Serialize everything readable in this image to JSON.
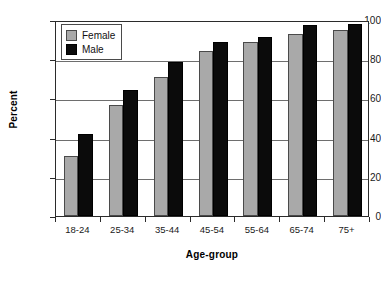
{
  "chart_data": {
    "type": "bar",
    "title": "",
    "subtitle": "",
    "xlabel": "Age-group",
    "ylabel": "Percent",
    "categories": [
      "18-24",
      "25-34",
      "35-44",
      "45-54",
      "55-64",
      "65-74",
      "75+"
    ],
    "series": [
      {
        "name": "Female",
        "color": "#a9a9a9",
        "values": [
          30.5,
          56.5,
          71.0,
          84.0,
          89.0,
          93.0,
          95.0
        ]
      },
      {
        "name": "Male",
        "color": "#0b0b0b",
        "values": [
          42.0,
          64.5,
          78.5,
          89.0,
          91.5,
          97.5,
          98.0
        ]
      }
    ],
    "ylim": [
      0,
      100
    ],
    "yticks": [
      0,
      20,
      40,
      60,
      80,
      100
    ],
    "ytick_labels": [
      "0",
      "20",
      "40",
      "60",
      "80",
      "100"
    ],
    "grid": true,
    "grid_axis": "y",
    "legend_position": "upper-left-inside",
    "legend_entries": [
      "Female",
      "Male"
    ]
  }
}
